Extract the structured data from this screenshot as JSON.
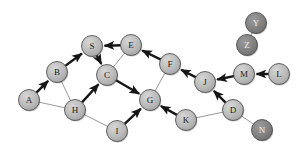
{
  "diagram": {
    "type": "node-link-graph",
    "canvas": {
      "width": 305,
      "height": 156,
      "background": "#ffffff"
    },
    "style": {
      "node_fill_light": "#b5b5b5",
      "node_fill_dark": "#7d7d7d",
      "node_stroke": "#4a4a4a",
      "node_radius": 10.5,
      "label_color_light": "#1a1a1a",
      "label_color_dark": "#f2f2f2",
      "thin_edge_color": "#8d8d8d",
      "bold_edge_color": "#161616",
      "thin_edge_width": 0.9,
      "bold_edge_width": 2.4
    },
    "nodes": [
      {
        "id": "A",
        "label": "A",
        "x": 29,
        "y": 100,
        "shade": "light"
      },
      {
        "id": "B",
        "label": "B",
        "x": 57,
        "y": 72,
        "shade": "light"
      },
      {
        "id": "S",
        "label": "S",
        "x": 92,
        "y": 46,
        "shade": "light"
      },
      {
        "id": "C",
        "label": "C",
        "x": 107,
        "y": 75,
        "shade": "light"
      },
      {
        "id": "E",
        "label": "E",
        "x": 131,
        "y": 45,
        "shade": "light"
      },
      {
        "id": "F",
        "label": "F",
        "x": 170,
        "y": 64,
        "shade": "light"
      },
      {
        "id": "H",
        "label": "H",
        "x": 75,
        "y": 110,
        "shade": "light"
      },
      {
        "id": "G",
        "label": "G",
        "x": 150,
        "y": 100,
        "shade": "light"
      },
      {
        "id": "I",
        "label": "I",
        "x": 117,
        "y": 131,
        "shade": "light"
      },
      {
        "id": "K",
        "label": "K",
        "x": 186,
        "y": 120,
        "shade": "light"
      },
      {
        "id": "J",
        "label": "J",
        "x": 205,
        "y": 82,
        "shade": "light"
      },
      {
        "id": "D",
        "label": "D",
        "x": 233,
        "y": 110,
        "shade": "light"
      },
      {
        "id": "M",
        "label": "M",
        "x": 244,
        "y": 74,
        "shade": "light"
      },
      {
        "id": "L",
        "label": "L",
        "x": 279,
        "y": 74,
        "shade": "light"
      },
      {
        "id": "N",
        "label": "N",
        "x": 262,
        "y": 130,
        "shade": "dark"
      },
      {
        "id": "Y",
        "label": "Y",
        "x": 256,
        "y": 23,
        "shade": "dark"
      },
      {
        "id": "Z",
        "label": "Z",
        "x": 247,
        "y": 45,
        "shade": "dark"
      }
    ],
    "edges_thin": [
      {
        "from": "A",
        "to": "H"
      },
      {
        "from": "B",
        "to": "H"
      },
      {
        "from": "S",
        "to": "C"
      },
      {
        "from": "C",
        "to": "E"
      },
      {
        "from": "E",
        "to": "F"
      },
      {
        "from": "F",
        "to": "G"
      },
      {
        "from": "G",
        "to": "K"
      },
      {
        "from": "H",
        "to": "I"
      },
      {
        "from": "K",
        "to": "D"
      },
      {
        "from": "D",
        "to": "N"
      },
      {
        "from": "Y",
        "to": "Z"
      },
      {
        "from": "J",
        "to": "M"
      },
      {
        "from": "C",
        "to": "G"
      }
    ],
    "edges_bold": [
      {
        "from": "A",
        "to": "B"
      },
      {
        "from": "B",
        "to": "S"
      },
      {
        "from": "E",
        "to": "S"
      },
      {
        "from": "S",
        "to": "C"
      },
      {
        "from": "H",
        "to": "C"
      },
      {
        "from": "C",
        "to": "G"
      },
      {
        "from": "I",
        "to": "G"
      },
      {
        "from": "K",
        "to": "G"
      },
      {
        "from": "F",
        "to": "E"
      },
      {
        "from": "J",
        "to": "F"
      },
      {
        "from": "D",
        "to": "J"
      },
      {
        "from": "M",
        "to": "J"
      },
      {
        "from": "L",
        "to": "M"
      }
    ]
  }
}
